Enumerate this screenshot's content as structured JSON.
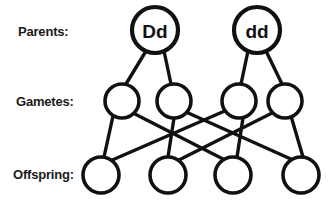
{
  "diagram": {
    "type": "genetic-cross",
    "width": 334,
    "height": 200,
    "background_color": "#ffffff",
    "stroke_color": "#111111",
    "text_color": "#1a1a1a"
  },
  "labels": {
    "parents": "Parents:",
    "gametes": "Gametes:",
    "offspring": "Offspring:"
  },
  "rows": {
    "parents": {
      "label": "Parents:",
      "label_x": 18,
      "label_y": 36,
      "radius": 23,
      "cy": 30,
      "nodes": [
        {
          "id": "parent-1",
          "genotype": "Dd",
          "cx": 155,
          "cy": 30
        },
        {
          "id": "parent-2",
          "genotype": "dd",
          "cx": 257,
          "cy": 30
        }
      ]
    },
    "gametes": {
      "label": "Gametes:",
      "label_x": 16,
      "label_y": 106,
      "radius": 17,
      "cy": 101,
      "nodes": [
        {
          "id": "gamete-1",
          "genotype": "",
          "cx": 122,
          "cy": 101
        },
        {
          "id": "gamete-2",
          "genotype": "",
          "cx": 174,
          "cy": 101
        },
        {
          "id": "gamete-3",
          "genotype": "",
          "cx": 239,
          "cy": 101
        },
        {
          "id": "gamete-4",
          "genotype": "",
          "cx": 285,
          "cy": 101
        }
      ]
    },
    "offspring": {
      "label": "Offspring:",
      "label_x": 13,
      "label_y": 179,
      "radius": 18,
      "cy": 175,
      "nodes": [
        {
          "id": "offspring-1",
          "genotype": "",
          "cx": 101,
          "cy": 175
        },
        {
          "id": "offspring-2",
          "genotype": "",
          "cx": 168,
          "cy": 175
        },
        {
          "id": "offspring-3",
          "genotype": "",
          "cx": 233,
          "cy": 175
        },
        {
          "id": "offspring-4",
          "genotype": "",
          "cx": 301,
          "cy": 175
        }
      ]
    }
  },
  "edges": {
    "parent_to_gamete": [
      {
        "id": "edge-p1-g1",
        "from": "parent-1",
        "to": "gamete-1",
        "x1": 146,
        "y1": 51,
        "x2": 126,
        "y2": 84
      },
      {
        "id": "edge-p1-g2",
        "from": "parent-1",
        "to": "gamete-2",
        "x1": 164,
        "y1": 51,
        "x2": 171,
        "y2": 84
      },
      {
        "id": "edge-p2-g3",
        "from": "parent-2",
        "to": "gamete-3",
        "x1": 248,
        "y1": 51,
        "x2": 241,
        "y2": 84
      },
      {
        "id": "edge-p2-g4",
        "from": "parent-2",
        "to": "gamete-4",
        "x1": 266,
        "y1": 51,
        "x2": 282,
        "y2": 84
      }
    ],
    "gamete_to_offspring": [
      {
        "id": "edge-g1-o1",
        "from": "gamete-1",
        "to": "offspring-1",
        "x1": 113,
        "y1": 116,
        "x2": 104,
        "y2": 157
      },
      {
        "id": "edge-g1-o3",
        "from": "gamete-1",
        "to": "offspring-3",
        "x1": 133,
        "y1": 113,
        "x2": 225,
        "y2": 160
      },
      {
        "id": "edge-g2-o2",
        "from": "gamete-2",
        "to": "offspring-2",
        "x1": 174,
        "y1": 118,
        "x2": 168,
        "y2": 157
      },
      {
        "id": "edge-g2-o4",
        "from": "gamete-2",
        "to": "offspring-4",
        "x1": 186,
        "y1": 112,
        "x2": 293,
        "y2": 160
      },
      {
        "id": "edge-g3-o1",
        "from": "gamete-3",
        "to": "offspring-1",
        "x1": 227,
        "y1": 110,
        "x2": 110,
        "y2": 161
      },
      {
        "id": "edge-g3-o3",
        "from": "gamete-3",
        "to": "offspring-3",
        "x1": 243,
        "y1": 118,
        "x2": 237,
        "y2": 157
      },
      {
        "id": "edge-g4-o2",
        "from": "gamete-4",
        "to": "offspring-2",
        "x1": 274,
        "y1": 112,
        "x2": 177,
        "y2": 161
      },
      {
        "id": "edge-g4-o4",
        "from": "gamete-4",
        "to": "offspring-4",
        "x1": 291,
        "y1": 116,
        "x2": 303,
        "y2": 157
      }
    ]
  }
}
